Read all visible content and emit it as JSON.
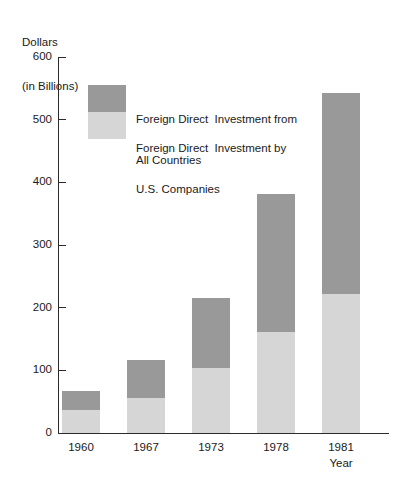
{
  "chart_data": {
    "type": "bar",
    "subtype": "stacked",
    "title": "",
    "ylabel": "Dollars\n(in Billions)",
    "ylabel_line1": "Dollars",
    "ylabel_line2": "(in Billions)",
    "xlabel": "Year",
    "categories": [
      "1960",
      "1967",
      "1973",
      "1978",
      "1981"
    ],
    "ylim": [
      0,
      600
    ],
    "yticks": [
      0,
      100,
      200,
      300,
      400,
      500,
      600
    ],
    "ytick_labels": [
      "0",
      "100",
      "200",
      "300",
      "400",
      "500",
      "600"
    ],
    "grid": false,
    "legend_position": "upper-left-inside",
    "series": [
      {
        "name": "Foreign Direct  Investment from\nAll Countries",
        "legend_line1": "Foreign Direct  Investment from",
        "legend_line2": "All Countries",
        "color": "#999999",
        "note": "upper segment; series total equals stacked bar total",
        "values": [
          30,
          60,
          113,
          221,
          321
        ],
        "cumulative_totals": [
          67,
          116,
          216,
          382,
          543
        ]
      },
      {
        "name": "Foreign Direct  Investment by\nU.S. Companies",
        "legend_line1": "Foreign Direct  Investment by",
        "legend_line2": "U.S. Companies",
        "color": "#d6d6d6",
        "note": "lower segment, drawn from baseline",
        "values": [
          37,
          56,
          103,
          161,
          222
        ]
      }
    ],
    "bar_totals": [
      67,
      116,
      216,
      382,
      543
    ]
  },
  "colors": {
    "dark_gray": "#999999",
    "light_gray": "#d6d6d6",
    "axis": "#2b2b2b",
    "background": "#ffffff",
    "text": "#1a1a1a"
  }
}
